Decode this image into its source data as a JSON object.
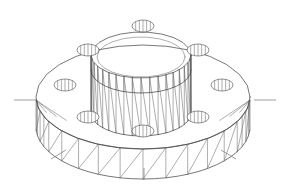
{
  "document": {
    "title": "Flanged Hub Wireframe",
    "view": "isometric",
    "background_color": "#ffffff",
    "line_color": "#4a4a4a",
    "thin_line_color": "#6b6b6b",
    "hatch_color": "#5a5a5a",
    "centerline_color": "#777777"
  },
  "geometry": {
    "canvas": {
      "width": 290,
      "height": 188
    },
    "flange": {
      "name": "flange-disc",
      "center": {
        "x": 143,
        "y": 97
      },
      "top_face_rx": 107,
      "top_face_ry": 52,
      "rim_height": 30,
      "rim_panel_count": 28,
      "edge_note": "triangulated rim band"
    },
    "hub": {
      "name": "central-hub-cylinder",
      "center": {
        "x": 141,
        "y": 55
      },
      "outer_rx": 50,
      "outer_ry": 23,
      "inner_rx": 44,
      "inner_ry": 20,
      "height": 58,
      "rib_count": 18,
      "mid_band_y": 62
    },
    "bolt_holes": {
      "name": "bolt-hole-set",
      "count": 8,
      "hatch_lines_per_hole": 5,
      "positions": [
        {
          "id": 1,
          "x": 88,
          "y": 50,
          "rx": 11,
          "ry": 6
        },
        {
          "id": 2,
          "x": 198,
          "y": 50,
          "rx": 11,
          "ry": 6
        },
        {
          "id": 3,
          "x": 65,
          "y": 85,
          "rx": 11,
          "ry": 6
        },
        {
          "id": 4,
          "x": 222,
          "y": 85,
          "rx": 11,
          "ry": 6
        },
        {
          "id": 5,
          "x": 88,
          "y": 117,
          "rx": 11,
          "ry": 6
        },
        {
          "id": 6,
          "x": 198,
          "y": 117,
          "rx": 11,
          "ry": 6
        },
        {
          "id": 7,
          "x": 143,
          "y": 131,
          "rx": 11,
          "ry": 6
        },
        {
          "id": 8,
          "x": 143,
          "y": 26,
          "rx": 11,
          "ry": 6
        }
      ]
    },
    "centerlines": [
      {
        "id": "left",
        "x1": 14,
        "y1": 100,
        "x2": 36,
        "y2": 100
      },
      {
        "id": "right",
        "x1": 254,
        "y1": 100,
        "x2": 276,
        "y2": 100
      },
      {
        "id": "bottom",
        "x1": 144,
        "y1": 168,
        "x2": 144,
        "y2": 180
      },
      {
        "id": "lower-left",
        "x1": 51,
        "y1": 159,
        "x2": 66,
        "y2": 150
      },
      {
        "id": "lower-right",
        "x1": 221,
        "y1": 150,
        "x2": 236,
        "y2": 159
      }
    ]
  },
  "labels": {
    "part_name": "Flanged Hub",
    "drawing_type": "3D Wireframe",
    "visible_text": ""
  }
}
